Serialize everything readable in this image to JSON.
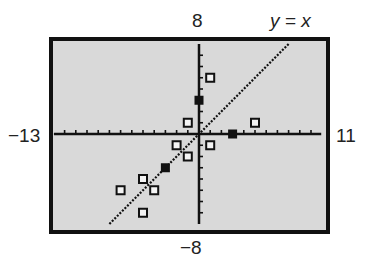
{
  "chart_data": {
    "type": "scatter",
    "title": "",
    "window": {
      "xmin": -13,
      "xmax": 11,
      "ymin": -8,
      "ymax": 8
    },
    "labels": {
      "ymax": "8",
      "ymin": "−8",
      "xmin": "−13",
      "xmax": "11",
      "line": "y = x"
    },
    "line": {
      "equation": "y = x",
      "from": [
        -8,
        -8
      ],
      "to": [
        8,
        8
      ],
      "style": "dotted"
    },
    "open_points": [
      [
        1,
        5
      ],
      [
        -1,
        1
      ],
      [
        5,
        1
      ],
      [
        1,
        -1
      ],
      [
        -2,
        -1
      ],
      [
        -1,
        -2
      ],
      [
        -5,
        -4
      ],
      [
        -4,
        -5
      ],
      [
        -7,
        -5
      ],
      [
        -5,
        -7
      ]
    ],
    "filled_points": [
      [
        0,
        3
      ],
      [
        3,
        0
      ],
      [
        -3,
        -3
      ]
    ],
    "grid": false,
    "background": "#d9d9d9",
    "xlabel": "",
    "ylabel": ""
  }
}
